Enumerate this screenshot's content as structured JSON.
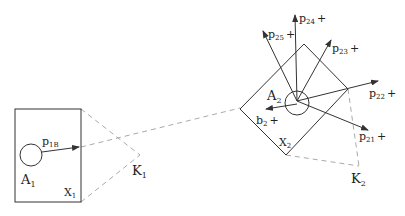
{
  "diagram": {
    "colors": {
      "line": "#333333",
      "dashed": "#aaaaaa",
      "text": "#222222"
    },
    "left_box": {
      "agent_label": "A",
      "agent_sub": "1",
      "region_label": "X",
      "region_sub": "1",
      "arrow_label": "p",
      "arrow_sub": "1B"
    },
    "k1": {
      "label": "K",
      "sub": "1"
    },
    "right_box": {
      "agent_label": "A",
      "agent_sub": "2",
      "region_label": "X",
      "region_sub": "2",
      "arrows": [
        {
          "label": "p",
          "sub": "25",
          "suffix": "+"
        },
        {
          "label": "p",
          "sub": "24",
          "suffix": "+"
        },
        {
          "label": "p",
          "sub": "23",
          "suffix": "+"
        },
        {
          "label": "p",
          "sub": "22",
          "suffix": "+"
        },
        {
          "label": "p",
          "sub": "21",
          "suffix": "+"
        },
        {
          "label": "b",
          "sub": "2",
          "suffix": "+"
        }
      ]
    },
    "k2": {
      "label": "K",
      "sub": "2"
    }
  }
}
